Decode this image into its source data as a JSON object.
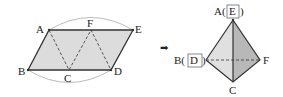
{
  "left_figure": {
    "description": "Parallelogram net folded into tetrahedron",
    "labels": {
      "A": "A",
      "E": "E",
      "F": "F",
      "B": "B",
      "C": "C",
      "D": "D"
    }
  },
  "arrow": {
    "glyph": "➡"
  },
  "right_figure": {
    "labels": {
      "top_prefix": "A(",
      "top_box": "E",
      "top_suffix": ")",
      "left_prefix": "B(",
      "left_box": "D",
      "left_suffix": ")",
      "right": "F",
      "bottom": "C"
    }
  },
  "colors": {
    "fill_light": "#d9d9d9",
    "fill_dark": "#b3b3b3",
    "stroke": "#333333",
    "arc": "#aaaaaa"
  }
}
